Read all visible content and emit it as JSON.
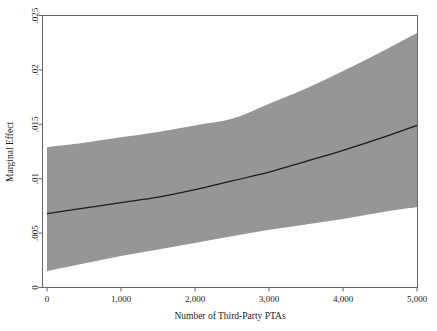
{
  "chart_data": {
    "type": "line",
    "title": "",
    "subtitle": "",
    "xlabel": "Number of Third-Party PTAs",
    "ylabel": "Marginal Effect",
    "xlim": [
      0,
      5000
    ],
    "ylim": [
      0,
      0.025
    ],
    "grid": false,
    "legend": null,
    "legend_position": "none",
    "x_tick_labels": [
      "0",
      "1,000",
      "2,000",
      "3,000",
      "4,000",
      "5,000"
    ],
    "x_tick_values": [
      0,
      1000,
      2000,
      3000,
      4000,
      5000
    ],
    "y_tick_labels": [
      "0",
      ".005",
      ".01",
      ".015",
      ".02",
      ".025"
    ],
    "y_tick_values": [
      0,
      0.005,
      0.01,
      0.015,
      0.02,
      0.025
    ],
    "x": [
      0,
      500,
      1000,
      1500,
      2000,
      2500,
      3000,
      3500,
      4000,
      4500,
      5000
    ],
    "series": [
      {
        "name": "Marginal Effect",
        "kind": "line",
        "color": "#1c1c1c",
        "values": [
          0.0068,
          0.0073,
          0.0078,
          0.0083,
          0.009,
          0.0098,
          0.0106,
          0.0116,
          0.0126,
          0.0137,
          0.0149
        ]
      },
      {
        "name": "Upper 95% Confidence Bound",
        "kind": "band-upper",
        "color": "#969696",
        "values": [
          0.0129,
          0.0133,
          0.0138,
          0.0143,
          0.0149,
          0.0155,
          0.0169,
          0.0183,
          0.0199,
          0.0216,
          0.0234
        ]
      },
      {
        "name": "Lower 95% Confidence Bound",
        "kind": "band-lower",
        "color": "#969696",
        "values": [
          0.0015,
          0.0022,
          0.0029,
          0.0035,
          0.0041,
          0.0047,
          0.0053,
          0.0058,
          0.0063,
          0.0069,
          0.0074
        ]
      }
    ],
    "band_fill_color": "#969696",
    "line_color": "#1c1c1c",
    "frame_color": "#555555"
  }
}
